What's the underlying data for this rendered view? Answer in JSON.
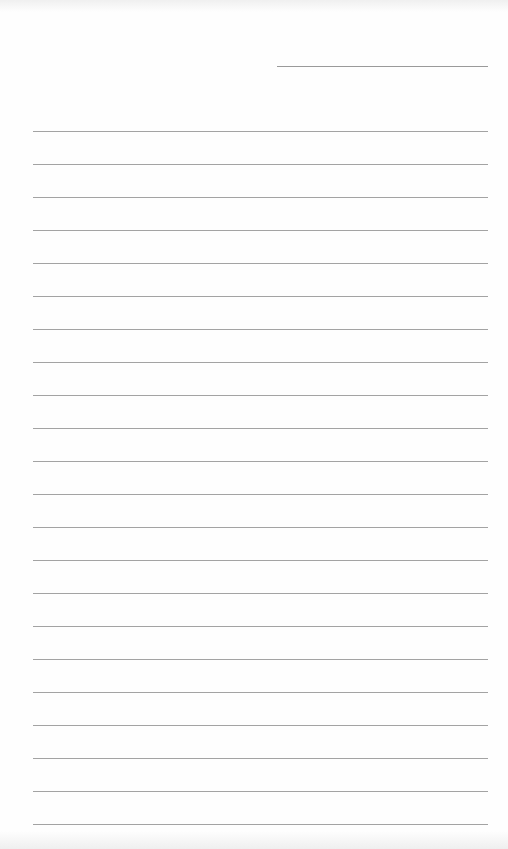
{
  "page": {
    "type": "blank lined notepaper",
    "background_color": "#fefefe",
    "line_color": "#a3a3a3"
  },
  "date_line": {
    "label": "",
    "value": ""
  },
  "ruled_lines": {
    "count": 22,
    "first_y": 131,
    "spacing": 33,
    "contents": [
      "",
      "",
      "",
      "",
      "",
      "",
      "",
      "",
      "",
      "",
      "",
      "",
      "",
      "",
      "",
      "",
      "",
      "",
      "",
      "",
      "",
      ""
    ]
  }
}
